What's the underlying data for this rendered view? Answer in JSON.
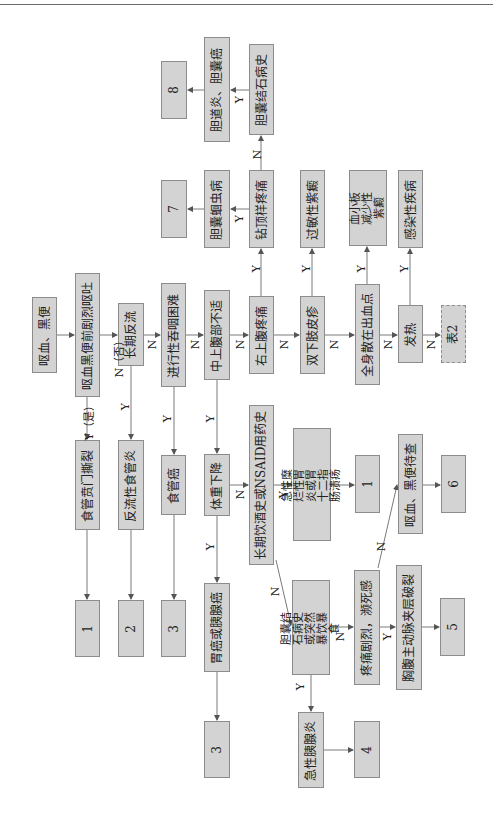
{
  "flowchart": {
    "orientation": "rotated-90-ccw",
    "nodes": {
      "start": "呕血、黑便",
      "q_vomit": "呕血黑便前剧烈呕吐",
      "d_mallory": "食管贲门撕裂",
      "r1a": "1",
      "q_reflux": "长期反流",
      "d_reflux": "反流性食管炎",
      "r2": "2",
      "q_dysphagia": "进行性吞咽困难",
      "d_esoph_cancer": "食管癌",
      "r3a": "3",
      "q_epigastric": "中上腹部不适",
      "q_weightloss": "体重下降",
      "d_gastric_pancreatic": "胃癌或胰腺癌",
      "r3b": "3",
      "q_ruq": "右上腹疼痛",
      "q_drilling": "钻顶样疼痛",
      "d_ascaris": "胆囊蛔虫病",
      "r7": "7",
      "q_gallstone_hist": "胆囊结石病史",
      "d_cholangitis": "胆道炎、胆囊癌",
      "r8": "8",
      "q_leg_rash": "双下肢皮疹",
      "d_allergic_purpura": "过敏性紫癜",
      "q_petechiae": "全身散在出血点",
      "d_itp": "血小板减少性紫癜",
      "q_fever": "发热",
      "d_infection": "感染性疾病",
      "ref_table2": "表2",
      "q_alcohol_nsaid": "长期饮酒史或NSAID用药史",
      "d_gastritis_ulcer": "急性糜烂性胃炎或胃十二指肠溃疡",
      "r1b": "1",
      "q_gallstone_binge": "胆囊结石病史或突然暴饮暴食",
      "d_pancreatitis": "急性胰腺炎",
      "r4": "4",
      "q_severe_pain": "疼痛剧烈，濒死感",
      "d_aortic": "胸腹主动脉夹层破裂",
      "r5": "5",
      "d_pending": "呕血、黑便待查",
      "r6": "6"
    },
    "labels": {
      "yes_full": "Y（是）",
      "no_full": "N（否）",
      "yes": "Y",
      "no": "N"
    },
    "colors": {
      "box_fill": "#d3d3d3",
      "box_border": "#8c8c8c",
      "line": "#6a6a6a"
    }
  }
}
